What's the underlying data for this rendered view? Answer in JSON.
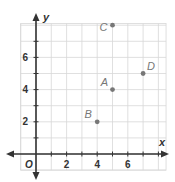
{
  "chart_data": {
    "type": "scatter",
    "title": "",
    "xlabel": "x",
    "ylabel": "y",
    "origin_label": "O",
    "xlim": [
      -1,
      8.5
    ],
    "ylim": [
      -1,
      8.1
    ],
    "grid": true,
    "x_ticks": [
      2,
      4,
      6
    ],
    "y_ticks": [
      2,
      4,
      6
    ],
    "points": [
      {
        "label": "A",
        "x": 5,
        "y": 4
      },
      {
        "label": "B",
        "x": 4,
        "y": 2
      },
      {
        "label": "C",
        "x": 5,
        "y": 8
      },
      {
        "label": "D",
        "x": 7,
        "y": 5
      }
    ]
  },
  "style": {
    "axis_color": "#333333",
    "grid_color": "#d8d8d8",
    "point_color": "#777777",
    "label_color": "#777777",
    "tick_label_color": "#333333"
  }
}
